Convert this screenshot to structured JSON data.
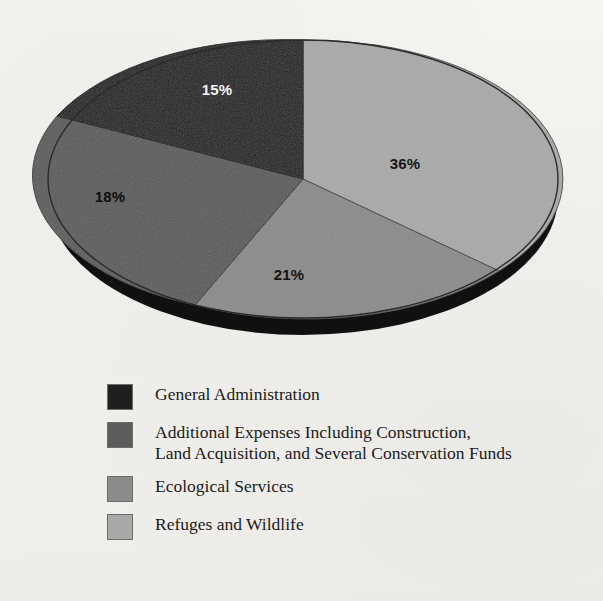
{
  "chart_data": {
    "type": "pie",
    "title": "",
    "categories": [
      "Refuges and Wildlife",
      "Ecological Services",
      "Additional Expenses Including Construction, Land Acquisition, and Several Conservation Funds",
      "General Administration"
    ],
    "values": [
      36,
      21,
      18,
      15
    ],
    "value_labels": [
      "36%",
      "21%",
      "18%",
      "15%"
    ],
    "unit": "%",
    "colors": [
      "#a9a9a9",
      "#8b8b8b",
      "#5c5c5c",
      "#1f1f1f"
    ],
    "start_angle_deg": 0,
    "direction": "clockwise",
    "legend_position": "below",
    "three_d": true,
    "grid": false
  },
  "pie": {
    "slices": [
      {
        "key": "refuges",
        "label": "36%",
        "value": 36,
        "color": "#a9a9a9",
        "rim_color": "#1a1a1a",
        "label_color": "#161616",
        "label_x": 405,
        "label_y": 163
      },
      {
        "key": "ecological",
        "label": "21%",
        "value": 21,
        "color": "#8b8b8b",
        "rim_color": "#1a1a1a",
        "label_color": "#141414",
        "label_x": 289,
        "label_y": 274
      },
      {
        "key": "additional",
        "label": "18%",
        "value": 18,
        "color": "#5c5c5c",
        "rim_color": "#151515",
        "label_color": "#0e0e0e",
        "label_x": 110,
        "label_y": 196
      },
      {
        "key": "general",
        "label": "15%",
        "value": 15,
        "color": "#1f1f1f",
        "rim_color": "#101010",
        "label_color": "#f4f4f4",
        "label_x": 217,
        "label_y": 89
      }
    ]
  },
  "legend": {
    "items": [
      {
        "key": "general-administration",
        "swatch_color": "#1f1f1f",
        "label": "General Administration"
      },
      {
        "key": "additional-expenses",
        "swatch_color": "#5c5c5c",
        "label": "Additional Expenses Including Construction,\nLand Acquisition, and Several Conservation Funds"
      },
      {
        "key": "ecological-services",
        "swatch_color": "#8b8b8b",
        "label": "Ecological Services"
      },
      {
        "key": "refuges-and-wildlife",
        "swatch_color": "#a9a9a9",
        "label": "Refuges and Wildlife"
      }
    ]
  }
}
